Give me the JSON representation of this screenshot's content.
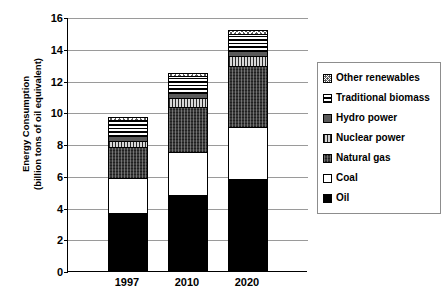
{
  "chart_data": {
    "type": "bar",
    "subtype": "stacked-column",
    "title": "",
    "xlabel": "",
    "ylabel": "Energy Consumption\n(billion tons of oil equivalent)",
    "categories": [
      "1997",
      "2010",
      "2020"
    ],
    "ylim": [
      0,
      16
    ],
    "yticks": [
      0,
      2,
      4,
      6,
      8,
      10,
      12,
      14,
      16
    ],
    "grid": true,
    "legend_position": "right",
    "series": [
      {
        "name": "Oil",
        "values": [
          3.6,
          4.7,
          5.7
        ],
        "pattern": "solid-black",
        "swatch": "p-oil"
      },
      {
        "name": "Coal",
        "values": [
          2.2,
          2.75,
          3.3
        ],
        "pattern": "solid-white",
        "swatch": "p-coal"
      },
      {
        "name": "Natural gas",
        "values": [
          2.0,
          2.85,
          3.9
        ],
        "pattern": "dark-speckle",
        "swatch": "p-gas"
      },
      {
        "name": "Nuclear power",
        "values": [
          0.4,
          0.6,
          0.6
        ],
        "pattern": "vertical-hatch-gray",
        "swatch": "p-nuclear"
      },
      {
        "name": "Hydro power",
        "values": [
          0.3,
          0.3,
          0.35
        ],
        "pattern": "solid-gray",
        "swatch": "p-hydro"
      },
      {
        "name": "Traditional biomass",
        "values": [
          1.0,
          1.1,
          1.1
        ],
        "pattern": "horizontal-lines",
        "swatch": "p-biomass"
      },
      {
        "name": "Other renewables",
        "values": [
          0.2,
          0.2,
          0.25
        ],
        "pattern": "checkered",
        "swatch": "p-other"
      }
    ],
    "totals": [
      9.7,
      12.5,
      15.2
    ]
  },
  "axis": {
    "y_title": "Energy Consumption\n(billion tons of oil equivalent)"
  }
}
